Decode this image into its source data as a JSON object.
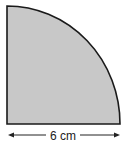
{
  "diagram": {
    "shape": "quarter-circle",
    "fill_color": "#c8c8c8",
    "stroke_color": "#1a1a1a",
    "radius_label": "6 cm",
    "dimension_arrow": "double-headed horizontal arrow along base"
  }
}
